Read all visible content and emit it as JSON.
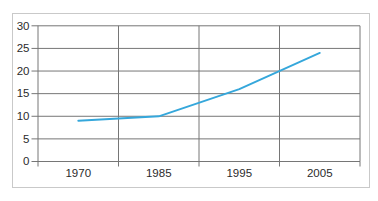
{
  "figure": {
    "background_color": "#ffffff",
    "frame_border_color": "#c9c9c9"
  },
  "chart_data": {
    "type": "line",
    "categories": [
      "1970",
      "1985",
      "1995",
      "2005"
    ],
    "values": [
      9,
      10,
      16,
      24
    ],
    "title": "",
    "xlabel": "",
    "ylabel": "",
    "ylim": [
      0,
      30
    ],
    "yticks": [
      0,
      5,
      10,
      15,
      20,
      25,
      30
    ],
    "grid": true,
    "legend": false,
    "line_color": "#35a7db",
    "grid_color": "#767676",
    "tick_color": "#767676",
    "label_color": "#2b2b2b"
  }
}
